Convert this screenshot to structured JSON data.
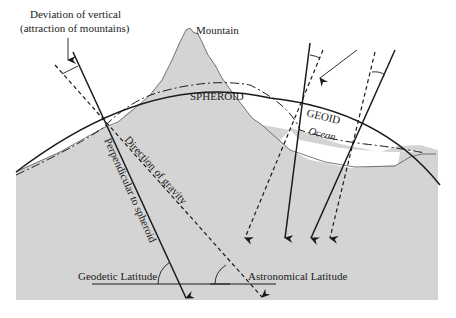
{
  "diagram": {
    "labels": {
      "deviation_line1": "Deviation of vertical",
      "deviation_line2": "(attraction of mountains)",
      "mountain": "Mountain",
      "spheroid": "SPHEROID",
      "geoid": "GEOID",
      "ocean": "Ocean",
      "direction_of_gravity": "Direction of gravity",
      "perpendicular_to_spheroid": "Perpendicular to spheroid",
      "geodetic_latitude": "Geodetic Latitude",
      "astronomical_latitude": "Astronomical Latitude"
    },
    "legend": {
      "spheroid_line": "solid curve",
      "geoid_line": "dash-dot curve",
      "perpendicular": "solid arrow",
      "gravity": "dashed arrow"
    },
    "colors": {
      "land": "#d4d4d4",
      "ocean": "#ffffff",
      "line": "#1a1a1a",
      "background": "#ffffff"
    }
  }
}
